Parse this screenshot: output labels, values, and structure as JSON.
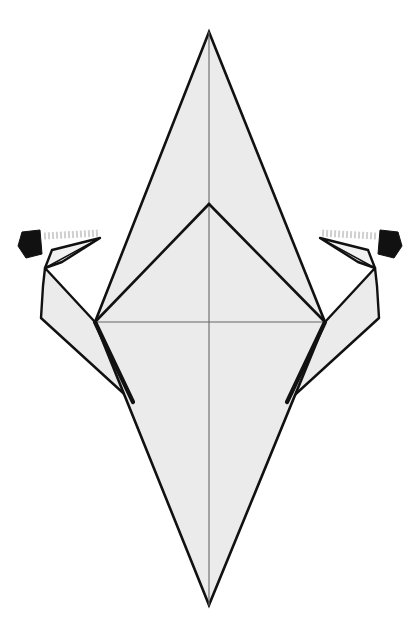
{
  "document": {
    "kind": "origami-folding-diagram",
    "title": "Origami step diagram — kite base with two side flaps being folded outward",
    "canvas": {
      "width": 414,
      "height": 640,
      "background": "#ffffff"
    }
  },
  "palette": {
    "paper_fill": "#ebebeb",
    "paper_fill_light": "#f2f2f2",
    "outline_stroke": "#111111",
    "crease_stroke": "#444444",
    "soft_crease_stroke": "#666666",
    "arrow_fill": "#111111",
    "arrow_shaft": "#cfcfcf",
    "white": "#ffffff"
  },
  "strokes": {
    "outline_width": 2.6,
    "heavy_edge_width": 4.2,
    "crease_width": 1.5,
    "soft_crease_width": 1.1,
    "flap_outline_width": 2.4
  },
  "geometry": {
    "top_apex": {
      "x": 209,
      "y": 32
    },
    "bottom_apex": {
      "x": 209,
      "y": 605
    },
    "left_vertex": {
      "x": 95,
      "y": 322
    },
    "right_vertex": {
      "x": 325,
      "y": 322
    },
    "inner_apex": {
      "x": 209,
      "y": 204
    },
    "center_line_x": 209,
    "horizontal_crease_y": 322,
    "left_wing_tip": {
      "x": 133,
      "y": 402
    },
    "right_wing_tip": {
      "x": 287,
      "y": 402
    }
  },
  "shapes": {
    "body_diamond": {
      "name": "main-diamond",
      "points": "209,32 325,322 209,605 95,322"
    },
    "inner_triangle": {
      "name": "inner-kite-triangle",
      "points": "209,204 325,322 95,322"
    },
    "left_upper_panel": {
      "name": "left-upper-panel",
      "points": "209,32 209,204 95,322"
    },
    "right_upper_panel": {
      "name": "right-upper-panel",
      "points": "209,32 325,322 209,204"
    },
    "left_lower_panel": {
      "name": "left-lower-panel",
      "points": "95,322 209,605 209,322"
    },
    "right_lower_panel": {
      "name": "right-lower-panel",
      "points": "209,322 209,605 325,322"
    },
    "left_wing": {
      "name": "left-wing-flap",
      "points": "95,322 45,268 43,286 41,318 133,402"
    },
    "right_wing": {
      "name": "right-wing-flap",
      "points": "325,322 375,268 377,286 379,318 287,402"
    },
    "left_beak": {
      "name": "left-beak-flap",
      "points": "45,268 52,250 100,238 62,262"
    },
    "right_beak": {
      "name": "right-beak-flap",
      "points": "375,268 368,250 320,238 358,262"
    }
  },
  "creases": [
    {
      "name": "center-vertical-crease",
      "x1": 209,
      "y1": 32,
      "x2": 209,
      "y2": 605,
      "style": "soft"
    },
    {
      "name": "horizontal-crease",
      "x1": 95,
      "y1": 322,
      "x2": 325,
      "y2": 322,
      "style": "soft"
    },
    {
      "name": "left-inner-fold",
      "x1": 209,
      "y1": 204,
      "x2": 95,
      "y2": 322,
      "style": "outline"
    },
    {
      "name": "right-inner-fold",
      "x1": 209,
      "y1": 204,
      "x2": 325,
      "y2": 322,
      "style": "outline"
    },
    {
      "name": "left-heavy-edge",
      "x1": 95,
      "y1": 322,
      "x2": 133,
      "y2": 402,
      "style": "heavy"
    },
    {
      "name": "right-heavy-edge",
      "x1": 325,
      "y1": 322,
      "x2": 287,
      "y2": 402,
      "style": "heavy"
    }
  ],
  "arrows": [
    {
      "name": "left-fold-arrow",
      "direction": "left",
      "head_points": "22,232 40,230 42,254 26,258 18,246",
      "shaft_start": {
        "x": 44,
        "y": 236
      },
      "shaft_end": {
        "x": 100,
        "y": 233
      }
    },
    {
      "name": "right-fold-arrow",
      "direction": "right",
      "head_points": "398,232 380,230 378,254 394,258 402,246",
      "shaft_start": {
        "x": 376,
        "y": 236
      },
      "shaft_end": {
        "x": 320,
        "y": 233
      }
    }
  ],
  "labels": {
    "figure_caption": "",
    "step_number": ""
  }
}
